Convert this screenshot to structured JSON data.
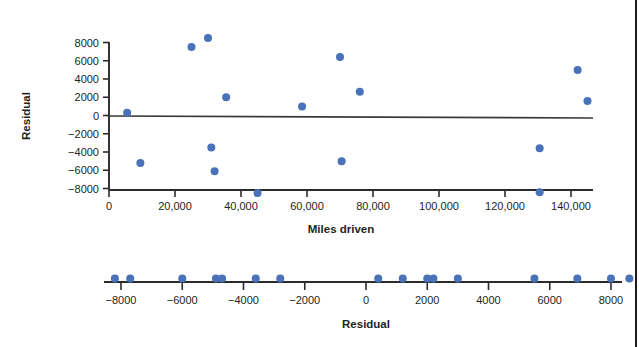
{
  "figure": {
    "background": "#ffffff",
    "marker_color": "#4a72b8",
    "axis_color": "#2b2b2b",
    "border_color": "#1b1b1b"
  },
  "chart_data": [
    {
      "type": "scatter",
      "title": "",
      "xlabel": "Miles driven",
      "ylabel": "Residual",
      "xlim": [
        -2000,
        153000
      ],
      "ylim": [
        -9500,
        9500
      ],
      "grid": false,
      "legend": "none",
      "xticks": [
        0,
        20000,
        40000,
        60000,
        80000,
        100000,
        120000,
        140000
      ],
      "xticklabels": [
        "0",
        "20,000",
        "40,000",
        "60,000",
        "80,000",
        "100,000",
        "120,000",
        "140,000"
      ],
      "yticks": [
        8000,
        6000,
        4000,
        2000,
        0,
        -2000,
        -4000,
        -6000,
        -8000
      ],
      "yticklabels": [
        "8000",
        "6000",
        "4000",
        "2000",
        "0",
        "−2000",
        "−4000",
        "−6000",
        "−8000"
      ],
      "reference_line": {
        "y": 0,
        "label": "zero residual line"
      },
      "points": [
        {
          "x": 5500,
          "y": 300
        },
        {
          "x": 9500,
          "y": -5200
        },
        {
          "x": 25000,
          "y": 7500
        },
        {
          "x": 30000,
          "y": 8500
        },
        {
          "x": 31000,
          "y": -3500
        },
        {
          "x": 32000,
          "y": -6100
        },
        {
          "x": 35500,
          "y": 2000
        },
        {
          "x": 45000,
          "y": -8500
        },
        {
          "x": 58500,
          "y": 1000
        },
        {
          "x": 70000,
          "y": 6400
        },
        {
          "x": 70500,
          "y": -5000
        },
        {
          "x": 76000,
          "y": 2600
        },
        {
          "x": 130500,
          "y": -3600
        },
        {
          "x": 130500,
          "y": -8400
        },
        {
          "x": 142000,
          "y": 5000
        },
        {
          "x": 145000,
          "y": 1600
        }
      ]
    },
    {
      "type": "scatter",
      "subtype": "dotplot",
      "title": "",
      "xlabel": "Residual",
      "ylabel": "",
      "xlim": [
        -9200,
        9500
      ],
      "grid": false,
      "legend": "none",
      "xticks": [
        -8000,
        -6000,
        -4000,
        -2000,
        0,
        2000,
        4000,
        6000,
        8000
      ],
      "xticklabels": [
        "−8000",
        "−6000",
        "−4000",
        "−2000",
        "0",
        "2000",
        "4000",
        "6000",
        "8000"
      ],
      "values": [
        -8200,
        -7700,
        -6000,
        -4900,
        -4700,
        -3600,
        -2800,
        400,
        1200,
        2000,
        2200,
        3000,
        5500,
        6900,
        8000,
        8600
      ]
    }
  ]
}
